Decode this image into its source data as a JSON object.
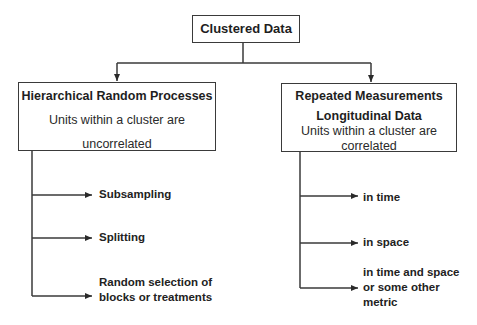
{
  "diagram": {
    "root": {
      "label": "Clustered Data"
    },
    "branches": [
      {
        "title": "Hierarchical Random Processes",
        "description_lines": [
          "Units within a cluster are",
          "uncorrelated"
        ],
        "children": [
          {
            "lines": [
              "Subsampling"
            ]
          },
          {
            "lines": [
              "Splitting"
            ]
          },
          {
            "lines": [
              "Random selection of",
              "blocks or treatments"
            ]
          }
        ]
      },
      {
        "title_lines": [
          "Repeated Measurements",
          "Longitudinal Data"
        ],
        "description_lines": [
          "Units within a cluster are",
          "correlated"
        ],
        "children": [
          {
            "lines": [
              "in time"
            ]
          },
          {
            "lines": [
              "in space"
            ]
          },
          {
            "lines": [
              "in time and space",
              "or some other",
              "metric"
            ]
          }
        ]
      }
    ]
  },
  "colors": {
    "line": "#3a3a3a",
    "text": "#1e1e1e",
    "background": "#ffffff"
  }
}
